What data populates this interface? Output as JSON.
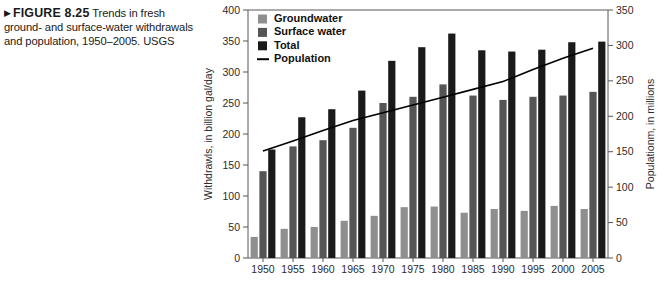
{
  "caption": {
    "marker": "▶",
    "figure_label": "FIGURE 8.25",
    "text": "Trends in fresh ground- and surface-water withdrawals and population, 1950–2005. USGS"
  },
  "legend": {
    "items": [
      {
        "label": "Groundwater",
        "color": "#8f8f8f",
        "type": "swatch"
      },
      {
        "label": "Surface water",
        "color": "#555555",
        "type": "swatch"
      },
      {
        "label": "Total",
        "color": "#1a1a1a",
        "type": "swatch"
      },
      {
        "label": "Population",
        "color": "#000000",
        "type": "line"
      }
    ]
  },
  "chart_data": {
    "type": "bar",
    "title": "",
    "xlabel": "",
    "ylabel": "Withdrawls, in billion gal/day",
    "y2label": "Populationm, in millions",
    "ylim": [
      0,
      400
    ],
    "y2lim": [
      0,
      350
    ],
    "yticks": [
      0,
      50,
      100,
      150,
      200,
      250,
      300,
      350,
      400
    ],
    "y2ticks": [
      0,
      50,
      100,
      150,
      200,
      250,
      300,
      350
    ],
    "grid": false,
    "legend_position": "top-left",
    "categories": [
      "1950",
      "1955",
      "1960",
      "1965",
      "1970",
      "1975",
      "1980",
      "1985",
      "1990",
      "1995",
      "2000",
      "2005"
    ],
    "series": [
      {
        "name": "Groundwater",
        "axis": "left",
        "units": "billion gal/day",
        "color": "#8f8f8f",
        "values": [
          34,
          47,
          50,
          60,
          68,
          82,
          83,
          73,
          79,
          76,
          84,
          79
        ]
      },
      {
        "name": "Surface water",
        "axis": "left",
        "units": "billion gal/day",
        "color": "#555555",
        "values": [
          140,
          180,
          190,
          210,
          250,
          260,
          280,
          262,
          255,
          260,
          262,
          268
        ]
      },
      {
        "name": "Total",
        "axis": "left",
        "units": "billion gal/day",
        "color": "#1a1a1a",
        "values": [
          175,
          227,
          240,
          270,
          318,
          340,
          362,
          335,
          333,
          336,
          348,
          349
        ]
      },
      {
        "name": "Population",
        "axis": "right",
        "units": "millions",
        "color": "#000000",
        "type": "line",
        "values": [
          151,
          165,
          180,
          194,
          205,
          216,
          227,
          238,
          249,
          266,
          282,
          296
        ]
      }
    ]
  }
}
